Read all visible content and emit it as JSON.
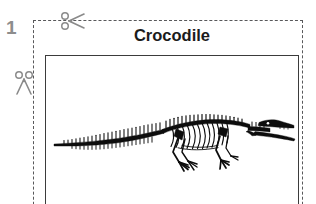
{
  "worksheet": {
    "item_number": "1",
    "animal_title": "Crocodile",
    "icons": {
      "scissors_top": "scissors-icon",
      "scissors_left": "scissors-icon",
      "illustration": "crocodile-skeleton-illustration"
    },
    "colors": {
      "number": "#8d8d8d",
      "title": "#1b1b1b",
      "cut_line": "#58585a",
      "frame_border": "#3b3b3b",
      "scissors": "#8a8a8a",
      "illustration": "#0d0d0d",
      "background": "#ffffff"
    }
  }
}
